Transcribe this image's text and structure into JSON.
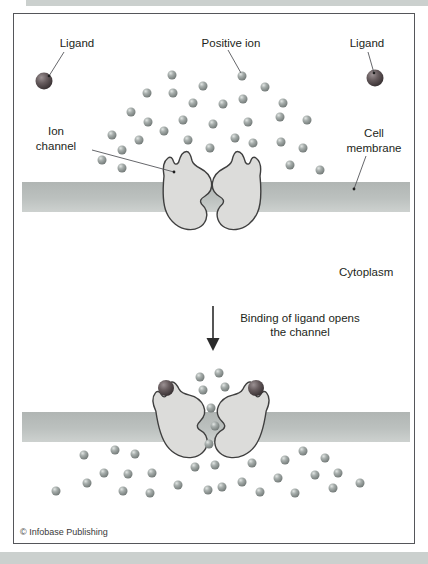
{
  "labels": {
    "ligand_left": "Ligand",
    "positive_ion": "Positive ion",
    "ligand_right": "Ligand",
    "ion_channel_line1": "Ion",
    "ion_channel_line2": "channel",
    "cell_membrane_line1": "Cell",
    "cell_membrane_line2": "membrane",
    "cytoplasm": "Cytoplasm",
    "binding_line1": "Binding of ligand opens",
    "binding_line2": "the channel",
    "copyright": "© Infobase Publishing"
  },
  "colors": {
    "membrane_dark": "#b0b5b3",
    "membrane_light": "#cdd1cf",
    "ion_highlight": "#e2e6e4",
    "ion_main": "#a7aeac",
    "ion_edge": "#707775",
    "ligand_highlight": "#9b9193",
    "ligand_main": "#675c5e",
    "ligand_edge": "#352e30",
    "channel_fill": "#dcdcda",
    "channel_stroke": "#3f3f3f",
    "text": "#231f20",
    "frame_border": "#55565a",
    "page_edge": "#cbd0ce",
    "leader_line": "#55565a",
    "arrow": "#2b2b2b"
  },
  "diagram": {
    "top_panel": {
      "membrane": {
        "x": 22,
        "y": 182,
        "width": 388,
        "height": 30
      },
      "ions": [
        [
          172,
          75
        ],
        [
          242,
          76
        ],
        [
          203,
          86
        ],
        [
          265,
          87
        ],
        [
          147,
          93
        ],
        [
          173,
          93
        ],
        [
          193,
          103
        ],
        [
          223,
          104
        ],
        [
          243,
          99
        ],
        [
          283,
          103
        ],
        [
          131,
          112
        ],
        [
          148,
          122
        ],
        [
          183,
          120
        ],
        [
          213,
          124
        ],
        [
          248,
          122
        ],
        [
          280,
          117
        ],
        [
          307,
          120
        ],
        [
          112,
          135
        ],
        [
          139,
          140
        ],
        [
          164,
          131
        ],
        [
          188,
          140
        ],
        [
          210,
          148
        ],
        [
          235,
          138
        ],
        [
          253,
          143
        ],
        [
          281,
          142
        ],
        [
          303,
          148
        ],
        [
          122,
          150
        ],
        [
          102,
          160
        ],
        [
          122,
          168
        ],
        [
          290,
          165
        ],
        [
          320,
          170
        ]
      ],
      "ligands": [
        [
          44,
          81
        ],
        [
          375,
          78
        ]
      ]
    },
    "bottom_panel": {
      "membrane": {
        "x": 22,
        "y": 412,
        "width": 388,
        "height": 30
      },
      "pore_ions": [
        [
          200,
          377
        ],
        [
          219,
          373
        ],
        [
          203,
          390
        ],
        [
          225,
          387
        ],
        [
          211,
          408
        ],
        [
          215,
          426
        ],
        [
          209,
          444
        ]
      ],
      "ions": [
        [
          56,
          491
        ],
        [
          84,
          455
        ],
        [
          87,
          483
        ],
        [
          104,
          473
        ],
        [
          115,
          450
        ],
        [
          123,
          491
        ],
        [
          128,
          474
        ],
        [
          135,
          454
        ],
        [
          150,
          493
        ],
        [
          152,
          473
        ],
        [
          178,
          485
        ],
        [
          195,
          467
        ],
        [
          208,
          490
        ],
        [
          215,
          465
        ],
        [
          222,
          487
        ],
        [
          242,
          482
        ],
        [
          252,
          463
        ],
        [
          260,
          492
        ],
        [
          278,
          478
        ],
        [
          285,
          460
        ],
        [
          295,
          493
        ],
        [
          303,
          451
        ],
        [
          315,
          475
        ],
        [
          325,
          458
        ],
        [
          333,
          488
        ],
        [
          338,
          473
        ],
        [
          360,
          483
        ]
      ],
      "bound_ligands": [
        [
          166,
          388
        ],
        [
          256,
          388
        ]
      ]
    }
  }
}
